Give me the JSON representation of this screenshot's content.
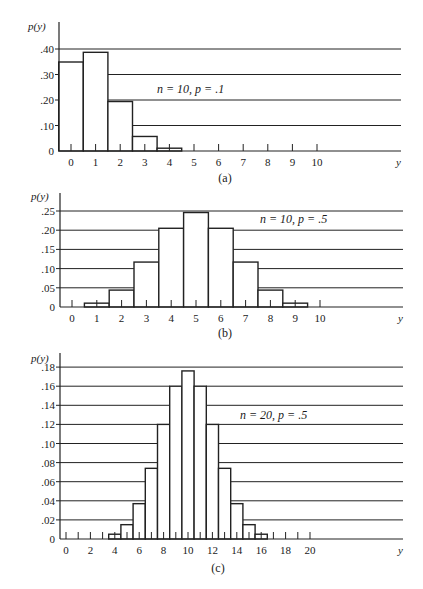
{
  "figure": {
    "panels": [
      {
        "id": "a",
        "caption": "(a)",
        "ylabel": "p(y)",
        "xlabel": "y",
        "annotation": "n = 10, p = .1",
        "ytick_labels": [
          "0",
          ".10",
          ".20",
          ".30",
          ".40"
        ],
        "xtick_labels": [
          "0",
          "1",
          "2",
          "3",
          "4",
          "5",
          "6",
          "7",
          "8",
          "9",
          "10"
        ]
      },
      {
        "id": "b",
        "caption": "(b)",
        "ylabel": "p(y)",
        "xlabel": "y",
        "annotation": "n = 10, p = .5",
        "ytick_labels": [
          "0",
          ".05",
          ".10",
          ".15",
          ".20",
          ".25"
        ],
        "xtick_labels": [
          "0",
          "1",
          "2",
          "3",
          "4",
          "5",
          "6",
          "7",
          "8",
          "9",
          "10"
        ]
      },
      {
        "id": "c",
        "caption": "(c)",
        "ylabel": "p(y)",
        "xlabel": "y",
        "annotation": "n = 20, p = .5",
        "ytick_labels": [
          "0",
          ".02",
          ".04",
          ".06",
          ".08",
          ".10",
          ".12",
          ".14",
          ".16",
          ".18"
        ],
        "xtick_labels": [
          "0",
          "2",
          "4",
          "6",
          "8",
          "10",
          "12",
          "14",
          "16",
          "18",
          "20"
        ]
      }
    ]
  },
  "chart_data": [
    {
      "type": "bar",
      "title": "(a)",
      "annotation": "n = 10, p = .1",
      "xlabel": "y",
      "ylabel": "p(y)",
      "categories": [
        0,
        1,
        2,
        3,
        4,
        5,
        6,
        7,
        8,
        9,
        10
      ],
      "values": [
        0.349,
        0.387,
        0.194,
        0.057,
        0.011,
        0.001,
        0.0,
        0.0,
        0.0,
        0.0,
        0.0
      ],
      "ylim": [
        0,
        0.4
      ],
      "yticks": [
        0,
        0.1,
        0.2,
        0.3,
        0.4
      ],
      "grid": true
    },
    {
      "type": "bar",
      "title": "(b)",
      "annotation": "n = 10, p = .5",
      "xlabel": "y",
      "ylabel": "p(y)",
      "categories": [
        0,
        1,
        2,
        3,
        4,
        5,
        6,
        7,
        8,
        9,
        10
      ],
      "values": [
        0.001,
        0.01,
        0.044,
        0.117,
        0.205,
        0.246,
        0.205,
        0.117,
        0.044,
        0.01,
        0.001
      ],
      "ylim": [
        0,
        0.25
      ],
      "yticks": [
        0,
        0.05,
        0.1,
        0.15,
        0.2,
        0.25
      ],
      "grid": true
    },
    {
      "type": "bar",
      "title": "(c)",
      "annotation": "n = 20, p = .5",
      "xlabel": "y",
      "ylabel": "p(y)",
      "categories": [
        0,
        1,
        2,
        3,
        4,
        5,
        6,
        7,
        8,
        9,
        10,
        11,
        12,
        13,
        14,
        15,
        16,
        17,
        18,
        19,
        20
      ],
      "values": [
        0.0,
        0.0,
        0.0002,
        0.001,
        0.005,
        0.015,
        0.037,
        0.074,
        0.12,
        0.16,
        0.176,
        0.16,
        0.12,
        0.074,
        0.037,
        0.015,
        0.005,
        0.001,
        0.0002,
        0.0,
        0.0
      ],
      "ylim": [
        0,
        0.18
      ],
      "yticks": [
        0,
        0.02,
        0.04,
        0.06,
        0.08,
        0.1,
        0.12,
        0.14,
        0.16,
        0.18
      ],
      "grid": true
    }
  ]
}
